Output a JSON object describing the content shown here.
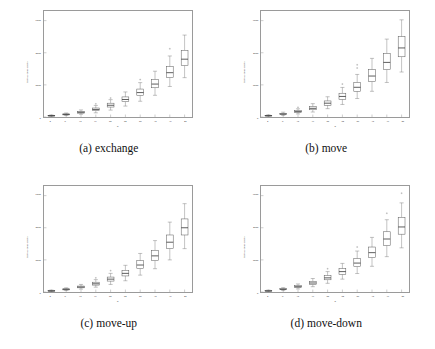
{
  "figure": {
    "panels": [
      {
        "id": "exchange",
        "caption_tag": "(a)",
        "caption_text": "exchange"
      },
      {
        "id": "move",
        "caption_tag": "(b)",
        "caption_text": "move"
      },
      {
        "id": "move-up",
        "caption_tag": "(c)",
        "caption_text": "move-up"
      },
      {
        "id": "move-down",
        "caption_tag": "(d)",
        "caption_text": "move-down"
      }
    ]
  },
  "chart_data": [
    {
      "type": "box",
      "title": "",
      "panel_label": "(a) exchange",
      "xlabel": "n",
      "ylabel": "fitness evaluations",
      "categories": [
        4,
        8,
        12,
        16,
        20,
        24,
        28,
        32,
        36,
        40
      ],
      "xticklabels": [
        "4",
        "8",
        "12",
        "16",
        "20",
        "24",
        "28",
        "32",
        "36",
        "40"
      ],
      "yticks": [
        0,
        2000,
        4000,
        6000
      ],
      "yticklabels": [
        "0",
        "2000",
        "4000",
        "6000"
      ],
      "ylim": [
        0,
        6600
      ],
      "grid": false,
      "legend": null,
      "boxes": [
        {
          "x": 4,
          "whisker_low": 40,
          "q1": 60,
          "median": 80,
          "q3": 100,
          "whisker_high": 130,
          "outliers": []
        },
        {
          "x": 8,
          "whisker_low": 90,
          "q1": 130,
          "median": 160,
          "q3": 195,
          "whisker_high": 250,
          "outliers": []
        },
        {
          "x": 12,
          "whisker_low": 170,
          "q1": 240,
          "median": 290,
          "q3": 350,
          "whisker_high": 440,
          "outliers": []
        },
        {
          "x": 16,
          "whisker_low": 260,
          "q1": 390,
          "median": 470,
          "q3": 560,
          "whisker_high": 720,
          "outliers": [
            820
          ]
        },
        {
          "x": 20,
          "whisker_low": 430,
          "q1": 620,
          "median": 730,
          "q3": 860,
          "whisker_high": 1080,
          "outliers": [
            1180
          ]
        },
        {
          "x": 24,
          "whisker_low": 680,
          "q1": 950,
          "median": 1090,
          "q3": 1250,
          "whisker_high": 1560,
          "outliers": []
        },
        {
          "x": 28,
          "whisker_low": 980,
          "q1": 1340,
          "median": 1520,
          "q3": 1740,
          "whisker_high": 2140,
          "outliers": [
            2330
          ]
        },
        {
          "x": 32,
          "whisker_low": 1350,
          "q1": 1820,
          "median": 2050,
          "q3": 2330,
          "whisker_high": 2850,
          "outliers": []
        },
        {
          "x": 36,
          "whisker_low": 1900,
          "q1": 2450,
          "median": 2760,
          "q3": 3130,
          "whisker_high": 3800,
          "outliers": [
            4250
          ]
        },
        {
          "x": 40,
          "whisker_low": 2450,
          "q1": 3200,
          "median": 3600,
          "q3": 4150,
          "whisker_high": 5100,
          "outliers": []
        }
      ]
    },
    {
      "type": "box",
      "title": "",
      "panel_label": "(b) move",
      "xlabel": "n",
      "ylabel": "fitness evaluations",
      "categories": [
        4,
        8,
        12,
        16,
        20,
        24,
        28,
        32,
        36,
        40
      ],
      "xticklabels": [
        "4",
        "8",
        "12",
        "16",
        "20",
        "24",
        "28",
        "32",
        "36",
        "40"
      ],
      "yticks": [
        0,
        2000,
        4000,
        6000
      ],
      "yticklabels": [
        "0",
        "2000",
        "4000",
        "6000"
      ],
      "ylim": [
        0,
        6600
      ],
      "grid": false,
      "legend": null,
      "boxes": [
        {
          "x": 4,
          "whisker_low": 40,
          "q1": 60,
          "median": 80,
          "q3": 100,
          "whisker_high": 140,
          "outliers": []
        },
        {
          "x": 8,
          "whisker_low": 100,
          "q1": 150,
          "median": 185,
          "q3": 225,
          "whisker_high": 300,
          "outliers": []
        },
        {
          "x": 12,
          "whisker_low": 190,
          "q1": 280,
          "median": 335,
          "q3": 400,
          "whisker_high": 510,
          "outliers": [
            600
          ]
        },
        {
          "x": 16,
          "whisker_low": 310,
          "q1": 450,
          "median": 540,
          "q3": 650,
          "whisker_high": 830,
          "outliers": []
        },
        {
          "x": 20,
          "whisker_low": 520,
          "q1": 730,
          "median": 860,
          "q3": 1000,
          "whisker_high": 1260,
          "outliers": []
        },
        {
          "x": 24,
          "whisker_low": 780,
          "q1": 1100,
          "median": 1280,
          "q3": 1480,
          "whisker_high": 1840,
          "outliers": [
            2050
          ]
        },
        {
          "x": 28,
          "whisker_low": 1150,
          "q1": 1600,
          "median": 1850,
          "q3": 2150,
          "whisker_high": 2650,
          "outliers": [
            3050,
            3250
          ]
        },
        {
          "x": 32,
          "whisker_low": 1600,
          "q1": 2200,
          "median": 2550,
          "q3": 2950,
          "whisker_high": 3650,
          "outliers": []
        },
        {
          "x": 36,
          "whisker_low": 2150,
          "q1": 2950,
          "median": 3400,
          "q3": 3950,
          "whisker_high": 4850,
          "outliers": []
        },
        {
          "x": 40,
          "whisker_low": 2800,
          "q1": 3750,
          "median": 4300,
          "q3": 5000,
          "whisker_high": 6050,
          "outliers": []
        }
      ]
    },
    {
      "type": "box",
      "title": "",
      "panel_label": "(c) move-up",
      "xlabel": "n",
      "ylabel": "fitness evaluations",
      "categories": [
        4,
        8,
        12,
        16,
        20,
        24,
        28,
        32,
        36,
        40
      ],
      "xticklabels": [
        "4",
        "8",
        "12",
        "16",
        "20",
        "24",
        "28",
        "32",
        "36",
        "40"
      ],
      "yticks": [
        0,
        2000,
        4000,
        6000
      ],
      "yticklabels": [
        "0",
        "2000",
        "4000",
        "6000"
      ],
      "ylim": [
        0,
        6600
      ],
      "grid": false,
      "legend": null,
      "boxes": [
        {
          "x": 4,
          "whisker_low": 30,
          "q1": 50,
          "median": 70,
          "q3": 90,
          "whisker_high": 120,
          "outliers": []
        },
        {
          "x": 8,
          "whisker_low": 90,
          "q1": 130,
          "median": 165,
          "q3": 200,
          "whisker_high": 260,
          "outliers": []
        },
        {
          "x": 12,
          "whisker_low": 180,
          "q1": 260,
          "median": 310,
          "q3": 370,
          "whisker_high": 470,
          "outliers": []
        },
        {
          "x": 16,
          "whisker_low": 300,
          "q1": 430,
          "median": 510,
          "q3": 610,
          "whisker_high": 770,
          "outliers": [
            880
          ]
        },
        {
          "x": 20,
          "whisker_low": 470,
          "q1": 680,
          "median": 800,
          "q3": 930,
          "whisker_high": 1160,
          "outliers": [
            1330
          ]
        },
        {
          "x": 24,
          "whisker_low": 700,
          "q1": 1000,
          "median": 1160,
          "q3": 1340,
          "whisker_high": 1660,
          "outliers": []
        },
        {
          "x": 28,
          "whisker_low": 1050,
          "q1": 1450,
          "median": 1680,
          "q3": 1950,
          "whisker_high": 2400,
          "outliers": []
        },
        {
          "x": 32,
          "whisker_low": 1450,
          "q1": 1950,
          "median": 2250,
          "q3": 2600,
          "whisker_high": 3200,
          "outliers": []
        },
        {
          "x": 36,
          "whisker_low": 2000,
          "q1": 2700,
          "median": 3100,
          "q3": 3550,
          "whisker_high": 4350,
          "outliers": []
        },
        {
          "x": 40,
          "whisker_low": 2700,
          "q1": 3550,
          "median": 4000,
          "q3": 4550,
          "whisker_high": 5500,
          "outliers": []
        }
      ]
    },
    {
      "type": "box",
      "title": "",
      "panel_label": "(d) move-down",
      "xlabel": "n",
      "ylabel": "fitness evaluations",
      "categories": [
        4,
        8,
        12,
        16,
        20,
        24,
        28,
        32,
        36,
        40
      ],
      "xticklabels": [
        "4",
        "8",
        "12",
        "16",
        "20",
        "24",
        "28",
        "32",
        "36",
        "40"
      ],
      "yticks": [
        0,
        2000,
        4000,
        6000
      ],
      "yticklabels": [
        "0",
        "2000",
        "4000",
        "6000"
      ],
      "ylim": [
        0,
        6600
      ],
      "grid": false,
      "legend": null,
      "boxes": [
        {
          "x": 4,
          "whisker_low": 30,
          "q1": 50,
          "median": 70,
          "q3": 90,
          "whisker_high": 120,
          "outliers": []
        },
        {
          "x": 8,
          "whisker_low": 90,
          "q1": 140,
          "median": 170,
          "q3": 210,
          "whisker_high": 270,
          "outliers": []
        },
        {
          "x": 12,
          "whisker_low": 190,
          "q1": 280,
          "median": 330,
          "q3": 390,
          "whisker_high": 500,
          "outliers": []
        },
        {
          "x": 16,
          "whisker_low": 330,
          "q1": 470,
          "median": 560,
          "q3": 660,
          "whisker_high": 840,
          "outliers": []
        },
        {
          "x": 20,
          "whisker_low": 540,
          "q1": 760,
          "median": 880,
          "q3": 1020,
          "whisker_high": 1270,
          "outliers": [
            1450
          ]
        },
        {
          "x": 24,
          "whisker_low": 800,
          "q1": 1100,
          "median": 1270,
          "q3": 1450,
          "whisker_high": 1780,
          "outliers": []
        },
        {
          "x": 28,
          "whisker_low": 1150,
          "q1": 1580,
          "median": 1800,
          "q3": 2080,
          "whisker_high": 2550,
          "outliers": [
            2800
          ]
        },
        {
          "x": 32,
          "whisker_low": 1600,
          "q1": 2150,
          "median": 2450,
          "q3": 2800,
          "whisker_high": 3400,
          "outliers": []
        },
        {
          "x": 36,
          "whisker_low": 2200,
          "q1": 2900,
          "median": 3300,
          "q3": 3750,
          "whisker_high": 4500,
          "outliers": [
            4900
          ]
        },
        {
          "x": 40,
          "whisker_low": 2750,
          "q1": 3600,
          "median": 4050,
          "q3": 4650,
          "whisker_high": 5550,
          "outliers": [
            6150
          ]
        }
      ]
    }
  ],
  "style": {
    "box_stroke": "#555555",
    "median_stroke": "#333333",
    "whisker_stroke": "#777777",
    "outlier_stroke": "#888888",
    "axis_stroke": "#9a9a9a",
    "background": "#ffffff"
  }
}
